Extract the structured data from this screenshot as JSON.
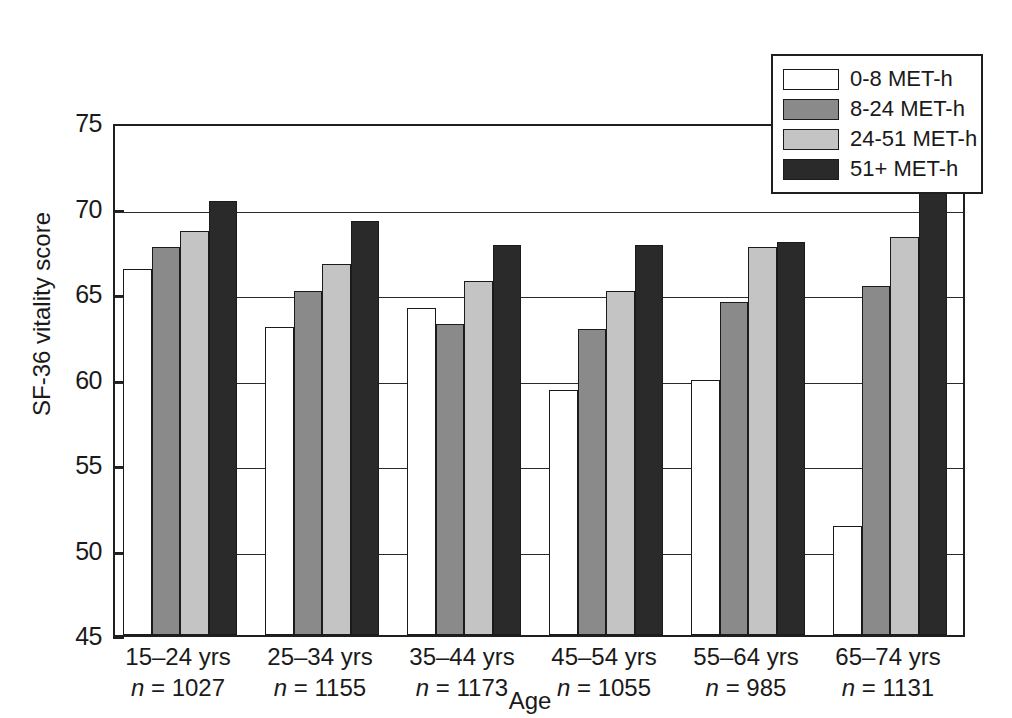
{
  "chart_data": {
    "type": "bar",
    "title": "",
    "xlabel": "Age",
    "ylabel": "SF-36 vitality score",
    "ylim": [
      45,
      75
    ],
    "yticks": [
      45,
      50,
      55,
      60,
      65,
      70,
      75
    ],
    "grid": true,
    "legend_position": "top-right",
    "categories": [
      "15–24 yrs",
      "25–34 yrs",
      "35–44 yrs",
      "45–54 yrs",
      "55–64 yrs",
      "65–74 yrs"
    ],
    "category_counts": [
      "n = 1027",
      "n = 1155",
      "n = 1173",
      "n = 1055",
      "n = 985",
      "n = 1131"
    ],
    "series": [
      {
        "name": "0-8 MET-h",
        "color": "#ffffff",
        "values": [
          66.4,
          63.0,
          64.1,
          59.3,
          59.9,
          51.4
        ]
      },
      {
        "name": "8-24 MET-h",
        "color": "#8a8a8a",
        "values": [
          67.7,
          65.1,
          63.2,
          62.9,
          64.5,
          65.4
        ]
      },
      {
        "name": "24-51 MET-h",
        "color": "#c4c4c4",
        "values": [
          68.6,
          66.7,
          65.7,
          65.1,
          67.7,
          68.3
        ]
      },
      {
        "name": "51+ MET-h",
        "color": "#2a2a2a",
        "values": [
          70.4,
          69.2,
          67.8,
          67.8,
          68.0,
          71.4
        ]
      }
    ]
  },
  "colors": {
    "axis": "#1f1f1f",
    "grid": "#2a2a2a",
    "bar_edge": "#1b1b1b",
    "background": "#ffffff",
    "text": "#1a1a1a"
  }
}
